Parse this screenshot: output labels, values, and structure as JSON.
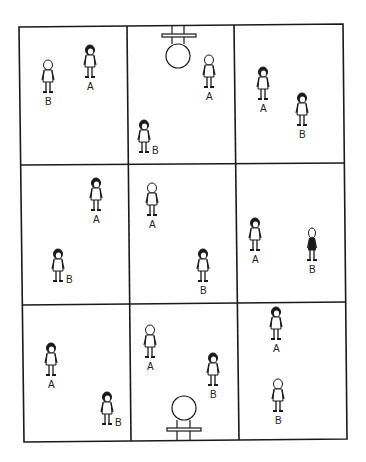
{
  "diagram": {
    "type": "court-positioning-grid",
    "rows": 3,
    "cols": 3,
    "line_color": "#1a1a1a",
    "hoops": [
      {
        "position": "top",
        "cell": [
          0,
          1
        ]
      },
      {
        "position": "bottom",
        "cell": [
          2,
          1
        ]
      }
    ],
    "panels": [
      {
        "row": 0,
        "col": 0,
        "players": [
          {
            "label": "B",
            "x": 48,
            "y": 80,
            "hair": "light"
          },
          {
            "label": "A",
            "x": 90,
            "y": 65,
            "hair": "dark"
          }
        ]
      },
      {
        "row": 0,
        "col": 1,
        "players": [
          {
            "label": "A",
            "x": 209,
            "y": 75,
            "hair": "light"
          },
          {
            "label": "B",
            "x": 144,
            "y": 140,
            "hair": "dark"
          }
        ]
      },
      {
        "row": 0,
        "col": 2,
        "players": [
          {
            "label": "A",
            "x": 263,
            "y": 87,
            "hair": "dark"
          },
          {
            "label": "B",
            "x": 302,
            "y": 113,
            "hair": "dark"
          }
        ]
      },
      {
        "row": 1,
        "col": 0,
        "players": [
          {
            "label": "A",
            "x": 96,
            "y": 198,
            "hair": "dark"
          },
          {
            "label": "B",
            "x": 58,
            "y": 269,
            "hair": "dark"
          }
        ]
      },
      {
        "row": 1,
        "col": 1,
        "players": [
          {
            "label": "A",
            "x": 152,
            "y": 203,
            "hair": "light"
          },
          {
            "label": "B",
            "x": 203,
            "y": 269,
            "hair": "dark"
          }
        ]
      },
      {
        "row": 1,
        "col": 2,
        "players": [
          {
            "label": "A",
            "x": 255,
            "y": 238,
            "hair": "dark"
          },
          {
            "label": "B",
            "x": 312,
            "y": 248,
            "hair": "light-thin"
          }
        ]
      },
      {
        "row": 2,
        "col": 0,
        "players": [
          {
            "label": "A",
            "x": 51,
            "y": 363,
            "hair": "dark"
          },
          {
            "label": "B",
            "x": 107,
            "y": 412,
            "hair": "dark"
          }
        ]
      },
      {
        "row": 2,
        "col": 1,
        "players": [
          {
            "label": "A",
            "x": 150,
            "y": 345,
            "hair": "light"
          },
          {
            "label": "B",
            "x": 213,
            "y": 373,
            "hair": "dark"
          }
        ]
      },
      {
        "row": 2,
        "col": 2,
        "players": [
          {
            "label": "A",
            "x": 276,
            "y": 327,
            "hair": "dark"
          },
          {
            "label": "B",
            "x": 278,
            "y": 399,
            "hair": "light"
          }
        ]
      }
    ]
  }
}
